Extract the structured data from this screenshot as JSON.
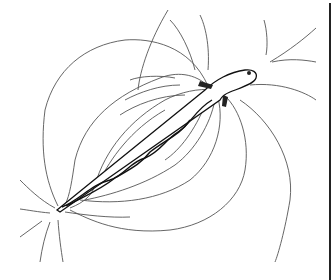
{
  "illustration": {
    "subject": "electric eel with electric field lines",
    "style": "black ink line drawing on white",
    "colors": {
      "ink": "#111111",
      "field_line": "#555555",
      "background": "#ffffff"
    }
  }
}
